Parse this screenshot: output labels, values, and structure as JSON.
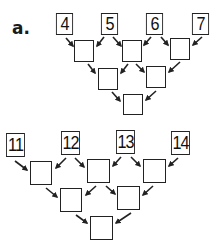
{
  "problems": [
    {
      "label": "a.",
      "top_numbers": [
        "4",
        "5",
        "6",
        "7"
      ],
      "rows": [
        [
          "4",
          "5",
          "6",
          "7"
        ],
        [
          "",
          "",
          ""
        ],
        [
          "",
          ""
        ],
        [
          ""
        ]
      ]
    },
    {
      "label": "",
      "top_numbers": [
        "11",
        "12",
        "13",
        "14"
      ],
      "rows": [
        [
          "11",
          "12",
          "13",
          "14"
        ],
        [
          "",
          "",
          ""
        ],
        [
          "",
          ""
        ],
        [
          ""
        ]
      ]
    }
  ],
  "colors": {
    "ink": "#222222",
    "background": "#ffffff"
  },
  "icons": {
    "arrow": "arrow-down-diagonal-icon"
  }
}
